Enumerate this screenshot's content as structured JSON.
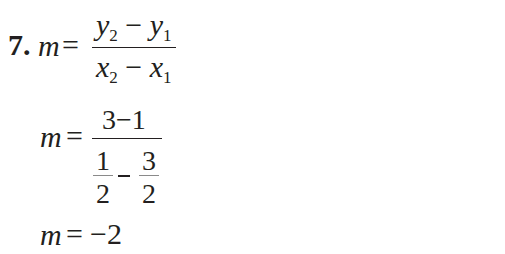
{
  "problem": {
    "number_label": "7.",
    "line1": {
      "lhs": "m",
      "equals": "=",
      "numerator": {
        "a": "y",
        "a_sub": "2",
        "op": "−",
        "b": "y",
        "b_sub": "1"
      },
      "denominator": {
        "a": "x",
        "a_sub": "2",
        "op": "−",
        "b": "x",
        "b_sub": "1"
      }
    },
    "line2": {
      "lhs": "m",
      "equals": "=",
      "numerator": "3−1",
      "denominator": {
        "left": {
          "num": "1",
          "den": "2"
        },
        "op": "−",
        "right": {
          "num": "3",
          "den": "2"
        }
      }
    },
    "line3": {
      "lhs": "m",
      "equals": "=",
      "rhs": "−2"
    }
  }
}
